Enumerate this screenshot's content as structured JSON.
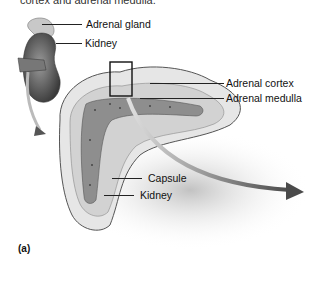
{
  "figure": {
    "caption_partial": "cortex and adrenal medulla.",
    "panel_label": "(a)",
    "labels": {
      "adrenal_gland": "Adrenal gland",
      "kidney_top": "Kidney",
      "adrenal_cortex": "Adrenal cortex",
      "adrenal_medulla": "Adrenal medulla",
      "capsule": "Capsule",
      "kidney_bottom": "Kidney"
    },
    "colors": {
      "line": "#222222",
      "tissue_light": "#d9d9d9",
      "tissue_mid": "#a8a8a8",
      "medulla": "#8c8c8c",
      "arrow": "#5a5a5a"
    }
  }
}
